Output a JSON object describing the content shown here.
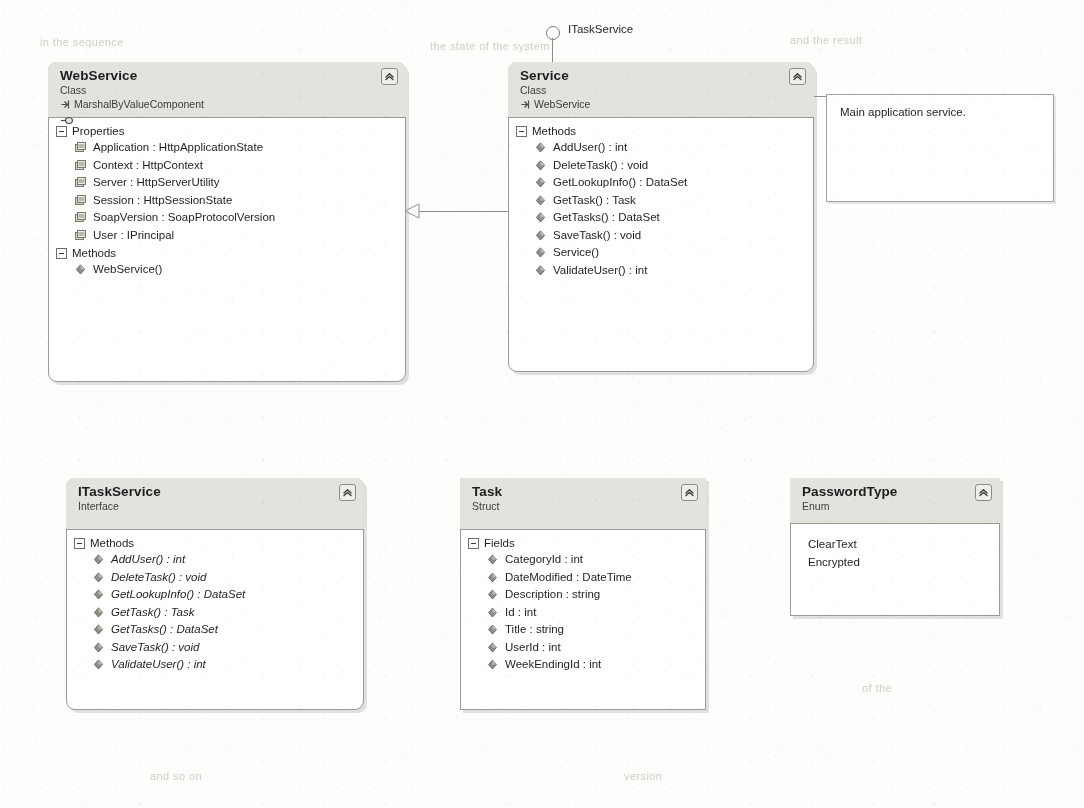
{
  "diagram": {
    "kind": "uml-class-diagram",
    "background": "#fdfdfb",
    "header_fill": "#e3e3de",
    "border_color": "#9a9a94"
  },
  "shapes": [
    {
      "id": "webservice",
      "name": "WebService",
      "stereotype": "Class",
      "base": "MarshalByValueComponent",
      "has_interface_badge": true,
      "collapse_icon": "chevron-up-double-icon",
      "compartments": [
        {
          "label": "Properties",
          "toggle_icon": "minus-box-icon",
          "members": [
            {
              "text": "Application : HttpApplicationState",
              "icon": "property-icon"
            },
            {
              "text": "Context : HttpContext",
              "icon": "property-icon"
            },
            {
              "text": "Server : HttpServerUtility",
              "icon": "property-icon"
            },
            {
              "text": "Session : HttpSessionState",
              "icon": "property-icon"
            },
            {
              "text": "SoapVersion : SoapProtocolVersion",
              "icon": "property-icon"
            },
            {
              "text": "User : IPrincipal",
              "icon": "property-icon"
            }
          ]
        },
        {
          "label": "Methods",
          "toggle_icon": "minus-box-icon",
          "members": [
            {
              "text": "WebService()",
              "icon": "method-icon"
            }
          ]
        }
      ]
    },
    {
      "id": "service",
      "name": "Service",
      "stereotype": "Class",
      "base": "WebService",
      "has_interface_badge": false,
      "collapse_icon": "chevron-up-double-icon",
      "compartments": [
        {
          "label": "Methods",
          "toggle_icon": "minus-box-icon",
          "members": [
            {
              "text": "AddUser() : int",
              "icon": "method-icon"
            },
            {
              "text": "DeleteTask() : void",
              "icon": "method-icon"
            },
            {
              "text": "GetLookupInfo() : DataSet",
              "icon": "method-icon"
            },
            {
              "text": "GetTask() : Task",
              "icon": "method-icon"
            },
            {
              "text": "GetTasks() : DataSet",
              "icon": "method-icon"
            },
            {
              "text": "SaveTask() : void",
              "icon": "method-icon"
            },
            {
              "text": "Service()",
              "icon": "method-icon"
            },
            {
              "text": "ValidateUser() : int",
              "icon": "method-icon"
            }
          ]
        }
      ]
    },
    {
      "id": "itaskservice",
      "name": "ITaskService",
      "stereotype": "Interface",
      "base": "",
      "has_interface_badge": false,
      "collapse_icon": "chevron-up-double-icon",
      "compartments": [
        {
          "label": "Methods",
          "toggle_icon": "minus-box-icon",
          "members": [
            {
              "text": "AddUser() : int",
              "icon": "method-icon"
            },
            {
              "text": "DeleteTask() : void",
              "icon": "method-icon"
            },
            {
              "text": "GetLookupInfo() : DataSet",
              "icon": "method-icon"
            },
            {
              "text": "GetTask() : Task",
              "icon": "method-icon"
            },
            {
              "text": "GetTasks() : DataSet",
              "icon": "method-icon"
            },
            {
              "text": "SaveTask() : void",
              "icon": "method-icon"
            },
            {
              "text": "ValidateUser() : int",
              "icon": "method-icon"
            }
          ]
        }
      ]
    },
    {
      "id": "task",
      "name": "Task",
      "stereotype": "Struct",
      "base": "",
      "has_interface_badge": false,
      "collapse_icon": "chevron-up-double-icon",
      "compartments": [
        {
          "label": "Fields",
          "toggle_icon": "minus-box-icon",
          "members": [
            {
              "text": "CategoryId : int",
              "icon": "field-icon"
            },
            {
              "text": "DateModified : DateTime",
              "icon": "field-icon"
            },
            {
              "text": "Description : string",
              "icon": "field-icon"
            },
            {
              "text": "Id : int",
              "icon": "field-icon"
            },
            {
              "text": "Title : string",
              "icon": "field-icon"
            },
            {
              "text": "UserId : int",
              "icon": "field-icon"
            },
            {
              "text": "WeekEndingId : int",
              "icon": "field-icon"
            }
          ]
        }
      ]
    },
    {
      "id": "passwordtype",
      "name": "PasswordType",
      "stereotype": "Enum",
      "base": "",
      "has_interface_badge": false,
      "collapse_icon": "chevron-up-double-icon",
      "compartments": [
        {
          "label": "",
          "toggle_icon": "",
          "members": [
            {
              "text": "ClearText",
              "icon": "none"
            },
            {
              "text": "Encrypted",
              "icon": "none"
            }
          ]
        }
      ]
    }
  ],
  "note": {
    "text": "Main application service.",
    "attached_to": "service"
  },
  "lollipop": {
    "label": "ITaskService",
    "icon": "interface-lollipop-icon",
    "attached_to": "service"
  },
  "inheritance": {
    "from": "service",
    "to": "webservice",
    "arrow": "hollow-triangle-icon"
  },
  "ghost_text": [
    {
      "text": "in the sequence",
      "x": 40,
      "y": 36
    },
    {
      "text": "the state of the system",
      "x": 430,
      "y": 40
    },
    {
      "text": "and the result",
      "x": 790,
      "y": 34
    },
    {
      "text": "we can use the",
      "x": 612,
      "y": 112
    },
    {
      "text": "in this case",
      "x": 120,
      "y": 98
    },
    {
      "text": "description",
      "x": 566,
      "y": 528
    },
    {
      "text": "the detail",
      "x": 300,
      "y": 620
    },
    {
      "text": "of the",
      "x": 862,
      "y": 682
    },
    {
      "text": "and so on",
      "x": 150,
      "y": 770
    },
    {
      "text": "version",
      "x": 624,
      "y": 770
    }
  ]
}
